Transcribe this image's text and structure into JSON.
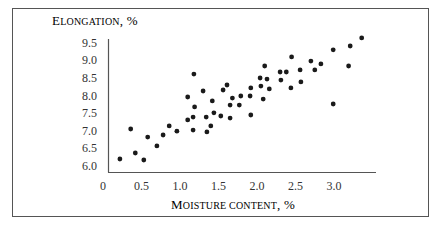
{
  "chart_data": {
    "type": "scatter",
    "title": "",
    "ylabel": "Elongation, %",
    "xlabel": "Moisture content, %",
    "ylabel_parts": {
      "cap": "E",
      "rest": "LONGATION",
      "suffix": ", %"
    },
    "xlabel_parts": {
      "cap": "M",
      "rest": "OISTURE CONTENT",
      "suffix": ", %"
    },
    "xlim": [
      0,
      3.5
    ],
    "ylim": [
      6.0,
      9.7
    ],
    "x_ticks": [
      "0",
      "0.5",
      "1.0",
      "1.5",
      "2.0",
      "2.5",
      "3.0"
    ],
    "y_ticks": [
      "9.5",
      "9.0",
      "8.5",
      "8.0",
      "7.5",
      "7.0",
      "6.5",
      "6.0"
    ],
    "grid": false,
    "legend": null,
    "marker_color": "#1a1a1a",
    "points": [
      [
        0.22,
        6.2
      ],
      [
        0.36,
        7.05
      ],
      [
        0.42,
        6.37
      ],
      [
        0.53,
        6.17
      ],
      [
        0.58,
        6.82
      ],
      [
        0.7,
        6.57
      ],
      [
        0.78,
        6.88
      ],
      [
        0.86,
        7.14
      ],
      [
        0.96,
        6.99
      ],
      [
        1.1,
        7.31
      ],
      [
        1.1,
        7.96
      ],
      [
        1.17,
        7.39
      ],
      [
        1.17,
        7.02
      ],
      [
        1.18,
        8.61
      ],
      [
        1.19,
        7.68
      ],
      [
        1.3,
        8.13
      ],
      [
        1.34,
        7.39
      ],
      [
        1.35,
        6.97
      ],
      [
        1.4,
        7.14
      ],
      [
        1.42,
        7.85
      ],
      [
        1.44,
        7.51
      ],
      [
        1.53,
        7.42
      ],
      [
        1.56,
        8.16
      ],
      [
        1.61,
        8.3
      ],
      [
        1.65,
        7.73
      ],
      [
        1.65,
        7.36
      ],
      [
        1.68,
        7.93
      ],
      [
        1.77,
        7.73
      ],
      [
        1.79,
        7.99
      ],
      [
        1.91,
        7.99
      ],
      [
        1.92,
        8.22
      ],
      [
        1.92,
        7.45
      ],
      [
        2.04,
        8.5
      ],
      [
        2.05,
        8.27
      ],
      [
        2.08,
        7.9
      ],
      [
        2.1,
        8.84
      ],
      [
        2.13,
        8.47
      ],
      [
        2.16,
        8.19
      ],
      [
        2.3,
        8.67
      ],
      [
        2.31,
        8.44
      ],
      [
        2.38,
        8.67
      ],
      [
        2.44,
        8.22
      ],
      [
        2.45,
        9.1
      ],
      [
        2.56,
        8.73
      ],
      [
        2.57,
        8.39
      ],
      [
        2.7,
        8.98
      ],
      [
        2.75,
        8.73
      ],
      [
        2.83,
        8.9
      ],
      [
        2.99,
        9.3
      ],
      [
        2.99,
        7.76
      ],
      [
        3.19,
        8.84
      ],
      [
        3.21,
        9.41
      ],
      [
        3.36,
        9.64
      ]
    ]
  }
}
